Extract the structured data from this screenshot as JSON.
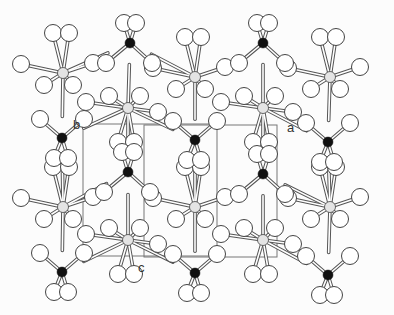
{
  "diagram": {
    "type": "crystal-structure-projection",
    "colors": {
      "background": "#fcfcfc",
      "oxygen_fill": "#ffffff",
      "metal_fill": "#e4e4e4",
      "phosphorus_fill": "#111111",
      "outline": "#444444",
      "bond_outer": "#555555",
      "bond_inner": "#ffffff",
      "cell": "#777777"
    },
    "axis_labels": [
      {
        "id": "a",
        "text": "a",
        "x": 287,
        "y": 121
      },
      {
        "id": "b",
        "text": "b",
        "x": 73,
        "y": 118
      },
      {
        "id": "c",
        "text": "c",
        "x": 138,
        "y": 261
      }
    ],
    "unit_cell": {
      "outer": {
        "x1": 83,
        "y1": 124,
        "x2": 277,
        "y2": 257
      },
      "front": {
        "x1": 83,
        "y1": 124,
        "x2": 217,
        "y2": 256
      },
      "back": {
        "x1": 144,
        "y1": 125,
        "x2": 277,
        "y2": 257
      }
    },
    "octahedral_centers": [
      {
        "x": 63,
        "y": 73
      },
      {
        "x": 195,
        "y": 77
      },
      {
        "x": 330,
        "y": 77
      },
      {
        "x": 128,
        "y": 108
      },
      {
        "x": 263,
        "y": 108
      },
      {
        "x": 63,
        "y": 207
      },
      {
        "x": 195,
        "y": 207
      },
      {
        "x": 330,
        "y": 207
      },
      {
        "x": 128,
        "y": 240
      },
      {
        "x": 263,
        "y": 240
      }
    ],
    "tetrahedral_centers": [
      {
        "x": 130,
        "y": 43
      },
      {
        "x": 263,
        "y": 43
      },
      {
        "x": 62,
        "y": 138
      },
      {
        "x": 195,
        "y": 140
      },
      {
        "x": 328,
        "y": 142
      },
      {
        "x": 128,
        "y": 172
      },
      {
        "x": 263,
        "y": 174
      },
      {
        "x": 62,
        "y": 272
      },
      {
        "x": 195,
        "y": 273
      },
      {
        "x": 328,
        "y": 275
      }
    ]
  }
}
